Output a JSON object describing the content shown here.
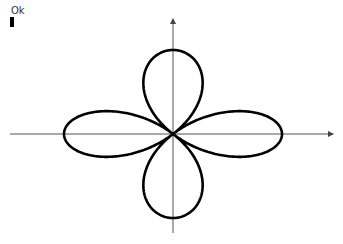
{
  "label": {
    "text": "Ok"
  },
  "figure": {
    "type": "polar-curve",
    "curve": "quadrifolium r = cos(2θ)",
    "origin": {
      "x": 173,
      "y": 134
    },
    "scale_x": 109,
    "scale_y": 84,
    "colors": {
      "curve": "#000000",
      "axis": "#555555"
    },
    "x_axis": {
      "from": 10,
      "to": 333
    },
    "y_axis": {
      "from": 233,
      "to": 19
    }
  }
}
